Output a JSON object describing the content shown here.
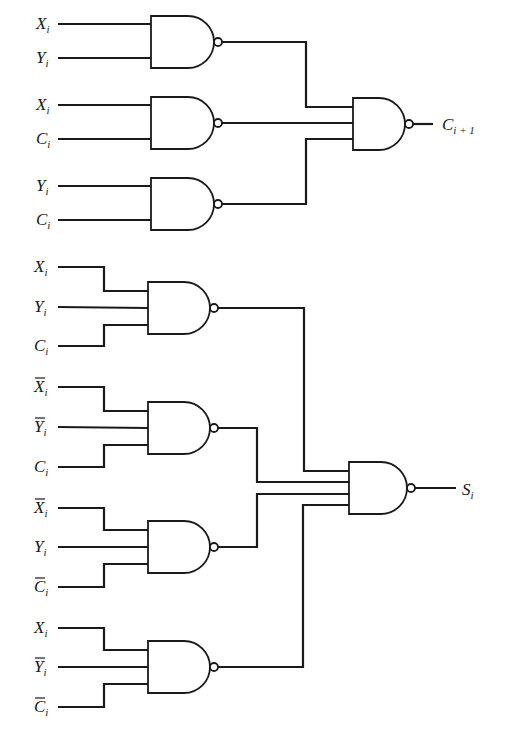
{
  "carry_section": {
    "gates": [
      {
        "id": "nand-c1",
        "inputs": [
          {
            "var": "X",
            "sub": "i",
            "bar": false
          },
          {
            "var": "Y",
            "sub": "i",
            "bar": false
          }
        ]
      },
      {
        "id": "nand-c2",
        "inputs": [
          {
            "var": "X",
            "sub": "i",
            "bar": false
          },
          {
            "var": "C",
            "sub": "i",
            "bar": false
          }
        ]
      },
      {
        "id": "nand-c3",
        "inputs": [
          {
            "var": "Y",
            "sub": "i",
            "bar": false
          },
          {
            "var": "C",
            "sub": "i",
            "bar": false
          }
        ]
      }
    ],
    "output": {
      "var": "C",
      "sub": "i + 1"
    }
  },
  "sum_section": {
    "gates": [
      {
        "id": "nand-s1",
        "inputs": [
          {
            "var": "X",
            "sub": "i",
            "bar": false
          },
          {
            "var": "Y",
            "sub": "i",
            "bar": false
          },
          {
            "var": "C",
            "sub": "i",
            "bar": false
          }
        ]
      },
      {
        "id": "nand-s2",
        "inputs": [
          {
            "var": "X",
            "sub": "i",
            "bar": true
          },
          {
            "var": "Y",
            "sub": "i",
            "bar": true
          },
          {
            "var": "C",
            "sub": "i",
            "bar": false
          }
        ]
      },
      {
        "id": "nand-s3",
        "inputs": [
          {
            "var": "X",
            "sub": "i",
            "bar": true
          },
          {
            "var": "Y",
            "sub": "i",
            "bar": false
          },
          {
            "var": "C",
            "sub": "i",
            "bar": true
          }
        ]
      },
      {
        "id": "nand-s4",
        "inputs": [
          {
            "var": "X",
            "sub": "i",
            "bar": false
          },
          {
            "var": "Y",
            "sub": "i",
            "bar": true
          },
          {
            "var": "C",
            "sub": "i",
            "bar": true
          }
        ]
      }
    ],
    "output": {
      "var": "S",
      "sub": "i"
    }
  },
  "colors": {
    "line": "#1a1a1a",
    "background": "#ffffff"
  }
}
